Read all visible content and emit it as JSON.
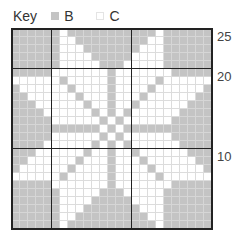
{
  "key": {
    "title": "Key",
    "items": [
      {
        "label": "B",
        "color": "#c4c4c4"
      },
      {
        "label": "C",
        "color": "#ffffff"
      }
    ]
  },
  "chart": {
    "columns": 25,
    "rows": 25,
    "row_labels": [
      {
        "label": "25",
        "row_index": 0
      },
      {
        "label": "20",
        "row_index": 5
      },
      {
        "label": "10",
        "row_index": 15
      }
    ],
    "thick_rows": [
      5,
      15
    ],
    "thick_cols": [
      5,
      15
    ],
    "legend_map": {
      "1": "B",
      "0": "C"
    },
    "pattern": [
      "1111110111111111110111111",
      "1111110011111111100111111",
      "1111110001111111000111111",
      "1111110000111110000111111",
      "1111110000011100000111111",
      "1111100000001000000011111",
      "0000001000001000001000000",
      "1000000100001000010000001",
      "1100000010001000100000011",
      "1110000001001001000000111",
      "1111000000101010000001111",
      "1111100000010100000011111",
      "1111111111101011111111111",
      "1111100000010100000011111",
      "1111000000101010000001111",
      "1110000001001001000000111",
      "1100000010001000100000011",
      "1000000100001000010000001",
      "0000001000001000001000000",
      "1111100000001000000011111",
      "1111110000011100000111111",
      "1111110000111110000111111",
      "1111110001111111000111111",
      "1111110011111111100111111",
      "1111110111111111110111111"
    ]
  }
}
